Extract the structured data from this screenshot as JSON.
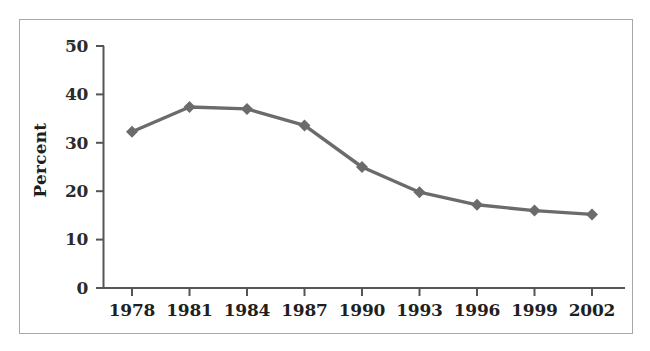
{
  "figure": {
    "frame_color": "#a8a8a8",
    "background": "#ffffff",
    "series_color": "#6b6b6b",
    "axis_color": "#555555",
    "text_color": "#1f1f1f"
  },
  "axis": {
    "ylabel": "Percent",
    "ytick_labels": [
      "0",
      "10",
      "20",
      "30",
      "40",
      "50"
    ],
    "xtick_labels": [
      "1978",
      "1981",
      "1984",
      "1987",
      "1990",
      "1993",
      "1996",
      "1999",
      "2002"
    ]
  },
  "chart_data": {
    "type": "line",
    "title": "",
    "xlabel": "",
    "ylabel": "Percent",
    "x": [
      1978,
      1981,
      1984,
      1987,
      1990,
      1993,
      1996,
      1999,
      2002
    ],
    "categories": [
      "1978",
      "1981",
      "1984",
      "1987",
      "1990",
      "1993",
      "1996",
      "1999",
      "2002"
    ],
    "values": [
      32.3,
      37.4,
      37.0,
      33.6,
      25.0,
      19.8,
      17.2,
      16.0,
      15.2
    ],
    "series": [
      {
        "name": "Percent",
        "color": "#6b6b6b",
        "marker": "diamond",
        "values": [
          32.3,
          37.4,
          37.0,
          33.6,
          25.0,
          19.8,
          17.2,
          16.0,
          15.2
        ]
      }
    ],
    "ylim": [
      0,
      50
    ],
    "yticks": [
      0,
      10,
      20,
      30,
      40,
      50
    ],
    "xlim": [
      1978,
      2002
    ],
    "grid": false,
    "legend": false
  }
}
